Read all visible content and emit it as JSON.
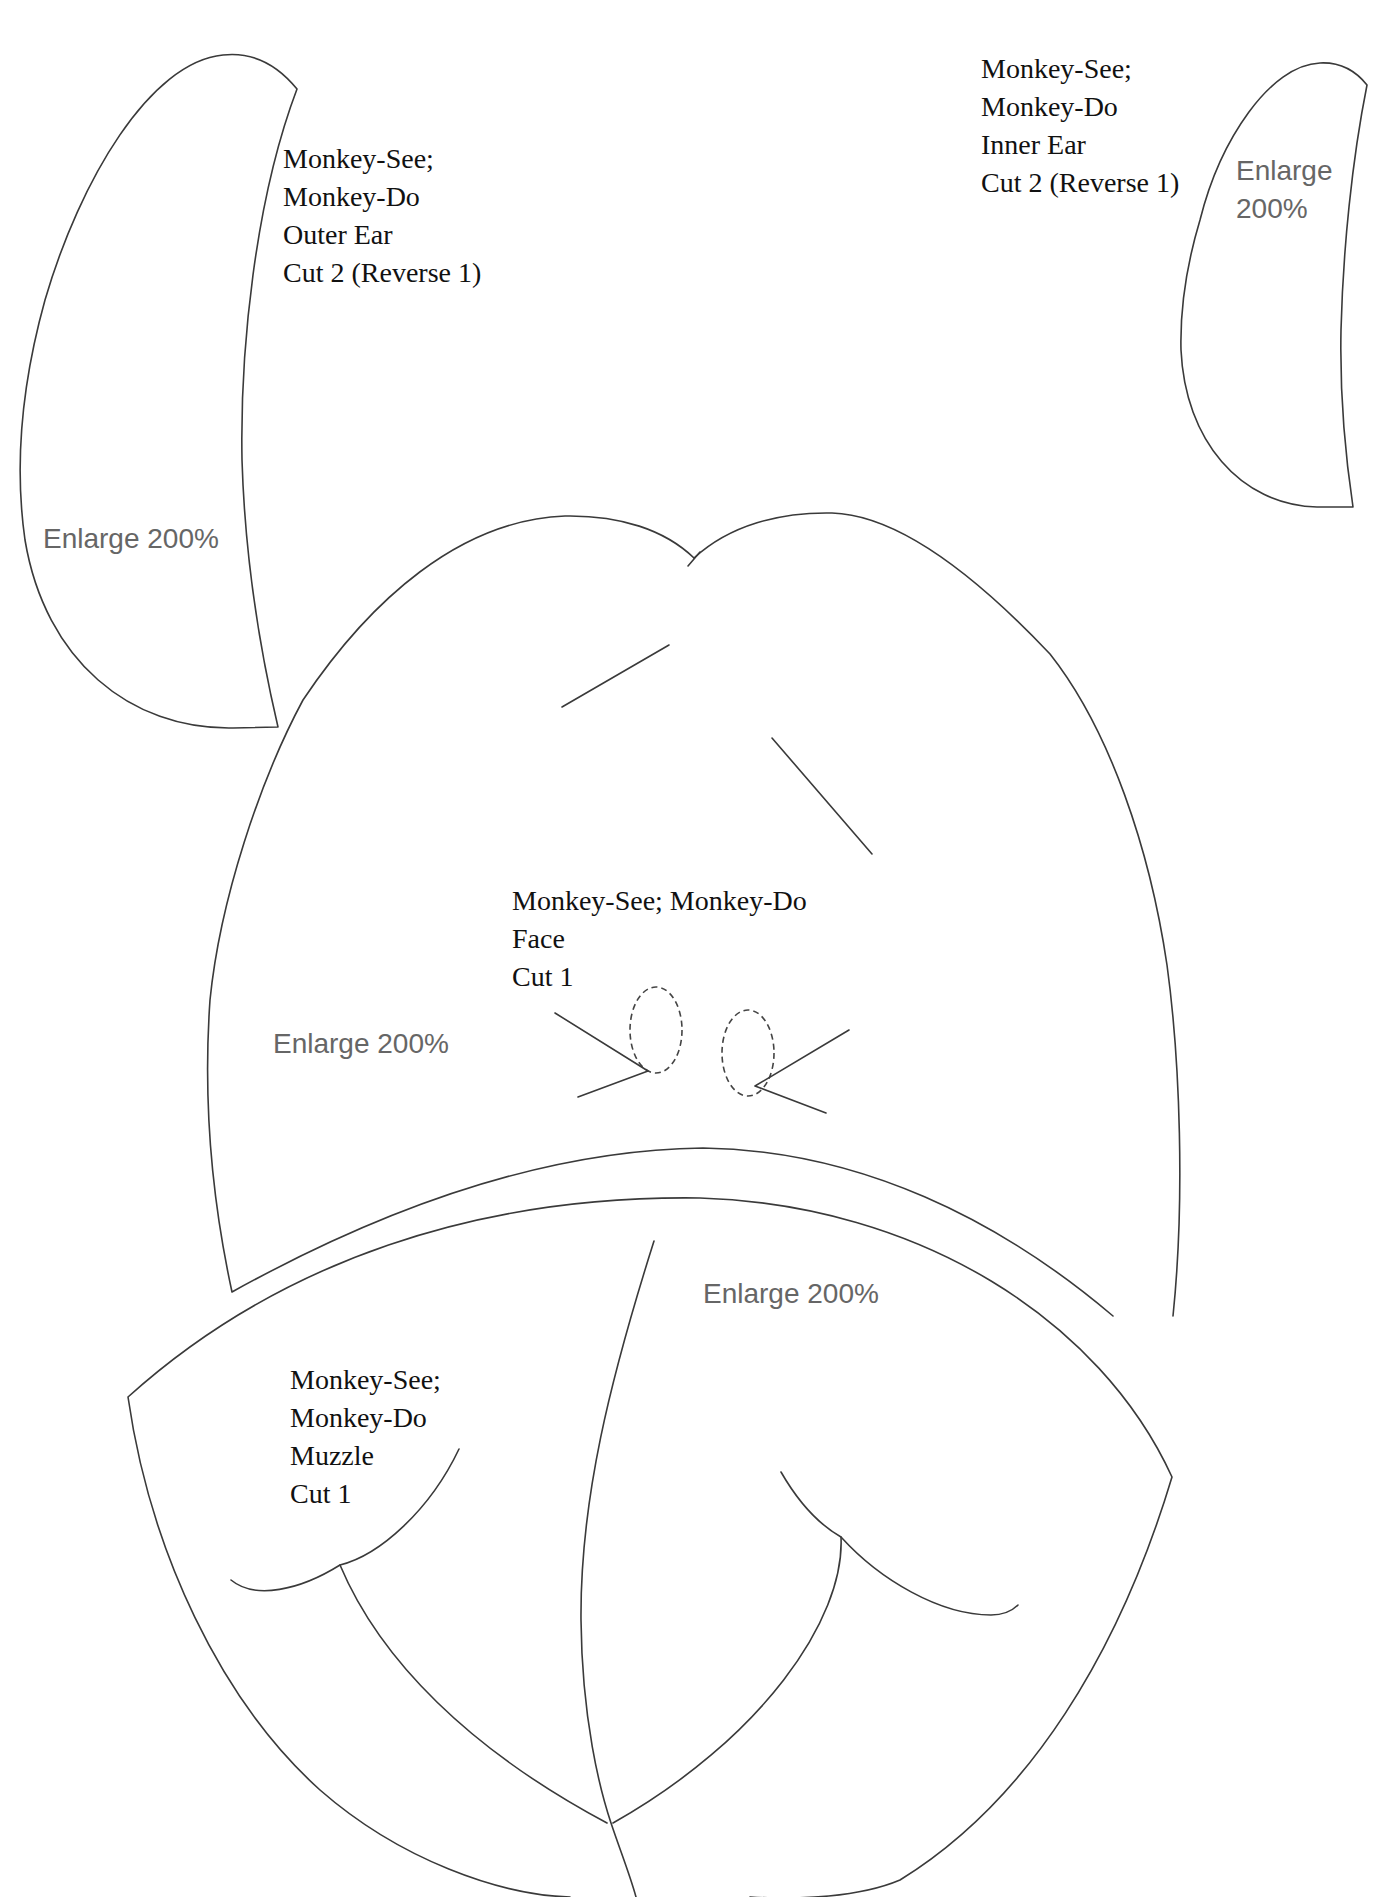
{
  "pattern": {
    "title": "Monkey-See; Monkey-Do",
    "line_color": "#3a3a3a",
    "note_color": "#666666",
    "pieces": {
      "outer_ear": {
        "lines": [
          "Monkey-See;",
          "Monkey-Do",
          "Outer Ear",
          "Cut 2 (Reverse 1)"
        ],
        "enlarge": "Enlarge 200%"
      },
      "inner_ear": {
        "lines": [
          "Monkey-See;",
          "Monkey-Do",
          "Inner Ear",
          "Cut 2 (Reverse 1)"
        ],
        "enlarge_lines": [
          "Enlarge",
          "200%"
        ]
      },
      "face": {
        "lines": [
          "Monkey-See; Monkey-Do",
          "Face",
          "Cut 1"
        ],
        "enlarge": "Enlarge 200%"
      },
      "muzzle": {
        "lines": [
          "Monkey-See;",
          "Monkey-Do",
          "Muzzle",
          "Cut 1"
        ],
        "enlarge": "Enlarge 200%"
      }
    }
  }
}
